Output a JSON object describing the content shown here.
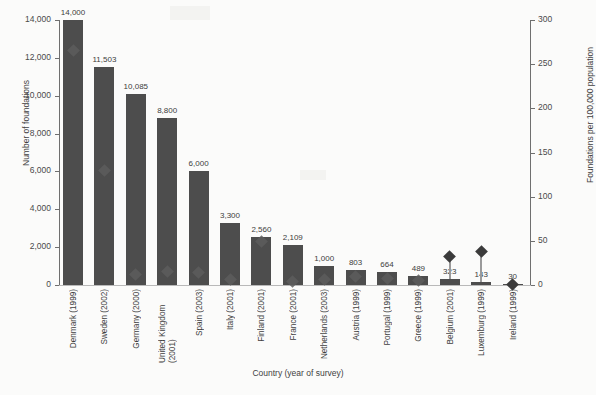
{
  "chart_data": {
    "type": "bar",
    "title": "",
    "xlabel": "Country (year of survey)",
    "ylabel": "Number of foundations",
    "y2label": "Foundations per 100,000 population",
    "grid": false,
    "legend": "none",
    "ylim": [
      0,
      14000
    ],
    "y2lim": [
      0,
      300
    ],
    "yticks": [
      "0",
      "2,000",
      "4,000",
      "6,000",
      "8,000",
      "10,000",
      "12,000",
      "14,000"
    ],
    "ytick_values": [
      0,
      2000,
      4000,
      6000,
      8000,
      10000,
      12000,
      14000
    ],
    "y2ticks": [
      "0",
      "50",
      "100",
      "150",
      "200",
      "250",
      "300"
    ],
    "y2tick_values": [
      0,
      50,
      100,
      150,
      200,
      250,
      300
    ],
    "categories": [
      "Denmark (1999)",
      "Sweden (2002)",
      "Germany (2000)",
      "United Kingdom (2001)",
      "Spain (2003)",
      "Italy (2001)",
      "Finland (2001)",
      "France (2001)",
      "Netherlands (2003)",
      "Austria (1999)",
      "Portugal (1999)",
      "Greece (1999)",
      "Belgium (2001)",
      "Luxemburg (1999)",
      "Ireland (1999)"
    ],
    "series": [
      {
        "name": "Number of foundations",
        "axis": "left",
        "type": "bar",
        "values": [
          14000,
          11503,
          10085,
          8800,
          6000,
          3300,
          2560,
          2109,
          1000,
          803,
          664,
          489,
          323,
          143,
          30
        ],
        "labels": [
          "14,000",
          "11,503",
          "10,085",
          "8,800",
          "6,000",
          "3,300",
          "2,560",
          "2,109",
          "1,000",
          "803",
          "664",
          "489",
          "323",
          "143",
          "30"
        ]
      },
      {
        "name": "Foundations per 100,000 population",
        "axis": "right",
        "type": "marker",
        "marker": "diamond",
        "values": [
          265,
          130,
          12,
          15,
          14,
          6,
          49,
          4,
          6,
          10,
          7,
          5,
          32,
          38,
          1
        ]
      }
    ],
    "bar_color": "#4d4d4d",
    "marker_color": "#6a6a6a"
  }
}
